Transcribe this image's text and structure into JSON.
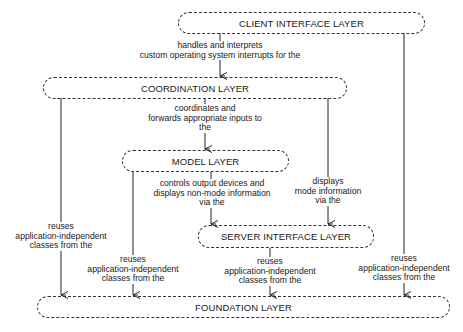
{
  "layers": {
    "client": "CLIENT INTERFACE LAYER",
    "coordination": "COORDINATION LAYER",
    "model": "MODEL LAYER",
    "server": "SERVER INTERFACE LAYER",
    "foundation": "FOUNDATION LAYER"
  },
  "edges": {
    "client_to_coordination": "handles and interprets\ncustom operating system interrupts for the",
    "coordination_to_model": "coordinates and\nforwards appropriate inputs to\nthe",
    "model_to_server": "controls output devices and\ndisplays non-mode information\nvia the",
    "coordination_to_server": "displays\nmode information\nvia the",
    "coordination_to_foundation": "reuses\napplication-independent\nclasses from the",
    "model_to_foundation": "reuses\napplication-independent\nclasses from the",
    "server_to_foundation": "reuses\napplication-independent\nclasses from the",
    "client_to_foundation": "reuses\napplication-independent\nclasses from the"
  }
}
